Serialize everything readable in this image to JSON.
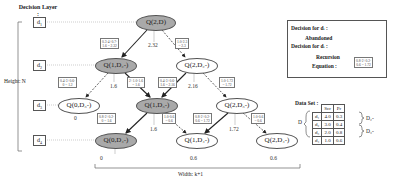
{
  "header": {
    "decision_layer_label": "Decision Layer :",
    "height_label": "Height: N",
    "width_label": "Width: k+1"
  },
  "layers": [
    {
      "label": "d",
      "sub": "1"
    },
    {
      "label": "d",
      "sub": "2"
    },
    {
      "label": "d",
      "sub": "3"
    },
    {
      "label": "d",
      "sub": "4"
    }
  ],
  "nodes": [
    {
      "id": "q2d",
      "text": "Q(2,D)",
      "selected": true,
      "value": "2.32"
    },
    {
      "id": "q1d2",
      "text": "Q(1,D₂-)",
      "selected": true,
      "value": "1.6"
    },
    {
      "id": "q2d2",
      "text": "Q(2,D₂-)",
      "selected": false,
      "value": "2.16"
    },
    {
      "id": "q0d3",
      "text": "Q(0,D₃-)",
      "selected": false,
      "value": "0"
    },
    {
      "id": "q1d3",
      "text": "Q(1,D₃-)",
      "selected": true,
      "value": "1.6"
    },
    {
      "id": "q2d3",
      "text": "Q(2,D₃-)",
      "selected": false,
      "value": "1.72"
    },
    {
      "id": "q0d4",
      "text": "Q(0,D₄-)",
      "selected": true,
      "value": "0"
    },
    {
      "id": "q1d4",
      "text": "Q(1,D₄-)",
      "selected": false,
      "value": "0.6"
    },
    {
      "id": "q2d4",
      "text": "Q(2,D₄-)",
      "selected": false,
      "value": "0.6"
    }
  ],
  "equations": [
    {
      "id": "eq1",
      "line1": "0.3·4+0.7·",
      "line2": "1.6 = 2.32"
    },
    {
      "id": "eq2",
      "line1": "1.0·2.3",
      "line2": "= 2.3"
    },
    {
      "id": "eq3",
      "line1": "0.4·3+0.6·",
      "line2": "0 = 1.2"
    },
    {
      "id": "eq4",
      "line1": "2+1.0·1.6",
      "line2": "= 1.6"
    },
    {
      "id": "eq5",
      "line1": "0.4·3+0.6·",
      "line2": "1.6 = 2.16"
    },
    {
      "id": "eq6",
      "line1": "1.0·1.72",
      "line2": "= 1.72"
    },
    {
      "id": "eq7",
      "line1": "0.8·2+0.2·",
      "line2": "0 = 1.6"
    },
    {
      "id": "eq8",
      "line1": "1.0·0.6",
      "line2": "= 0.6"
    },
    {
      "id": "eq9",
      "line1": "0.8·2+0.2·",
      "line2": "0.6 = 1.72"
    },
    {
      "id": "eq10",
      "line1": "1.0·0.6",
      "line2": "= 0.6"
    }
  ],
  "legend": {
    "decision_label": "Decision for dᵢ :",
    "abandoned_label_1": "Abandoned",
    "abandoned_label_2": "Decision for dᵢ :",
    "recursion_label": "Recursion",
    "equation_label": "Equation :",
    "sample_eq_line1": "0.8·2+0.2·",
    "sample_eq_line2": "0.6 = 1.72"
  },
  "dataset": {
    "title": "Data Set :",
    "set_label": "D",
    "columns": [
      "Scr",
      "Pr"
    ],
    "rows": [
      {
        "name": "d₁",
        "scr": "4.0",
        "pr": "0.3"
      },
      {
        "name": "d₂",
        "scr": "3.0",
        "pr": "0.4"
      },
      {
        "name": "d₃",
        "scr": "2.0",
        "pr": "0.8"
      },
      {
        "name": "d₄",
        "scr": "1.0",
        "pr": "0.6"
      }
    ],
    "groups": [
      "D₂-",
      "D₃-"
    ]
  },
  "colors": {
    "selected_node": "#a9a9a9",
    "edge": "#333333",
    "guide": "#999999"
  }
}
